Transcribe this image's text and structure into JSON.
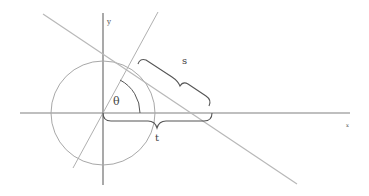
{
  "diagram": {
    "labels": {
      "y_axis": "y",
      "x_axis": "x",
      "angle": "θ",
      "tangent_segment": "s",
      "axis_segment": "t"
    },
    "colors": {
      "background": "#ffffff",
      "axes": "#777777",
      "circle": "#aaaaaa",
      "lines": "#b5b5b5",
      "braces": "#555555",
      "text": "#444444"
    }
  }
}
